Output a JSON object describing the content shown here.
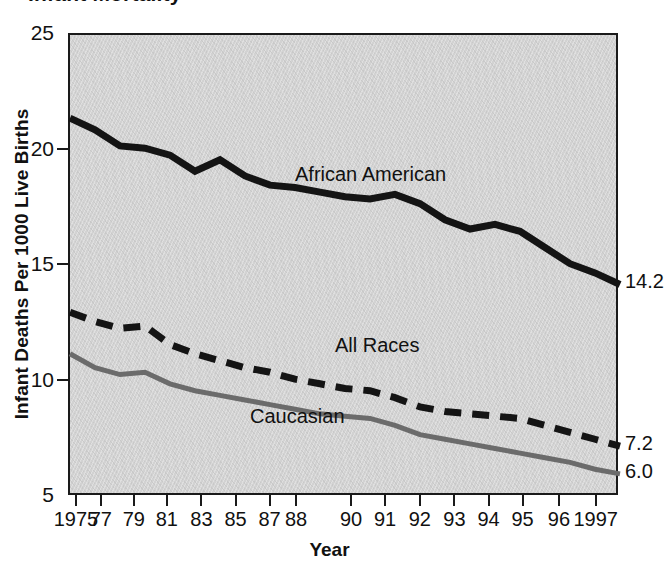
{
  "title": "Infant Mortality",
  "chart_data": {
    "type": "line",
    "title": "Infant Mortality",
    "xlabel": "Year",
    "ylabel": "Infant Deaths Per 1000 Live Births",
    "xlim": [
      1975,
      1997
    ],
    "ylim": [
      5,
      25
    ],
    "yticks": [
      25,
      20,
      15,
      10,
      5
    ],
    "ytick_labels": [
      "25",
      "20",
      "15",
      "10",
      "5"
    ],
    "grid": false,
    "legend": "inline-labels",
    "x": [
      1975,
      1976,
      1977,
      1978,
      1979,
      1980,
      1981,
      1982,
      1983,
      1984,
      1985,
      1986,
      1987,
      1988,
      1989,
      1990,
      1991,
      1992,
      1993,
      1994,
      1995,
      1996,
      1997
    ],
    "xtick_years": [
      1975,
      1977,
      1979,
      1981,
      1983,
      1985,
      1987,
      1988,
      1990,
      1991,
      1992,
      1993,
      1994,
      1995,
      1996,
      1997
    ],
    "xtick_labels": [
      "1975",
      "77",
      "79",
      "81",
      "83",
      "85",
      "87",
      "88",
      "90",
      "91",
      "92",
      "93",
      "94",
      "95",
      "96",
      "1997"
    ],
    "series": [
      {
        "name": "African American",
        "style": "solid",
        "color": "#141414",
        "width": 7,
        "label_x": 1984.0,
        "label_y": 18.95,
        "end_value": "14.2",
        "values": [
          21.4,
          20.9,
          20.2,
          20.1,
          19.8,
          19.1,
          19.6,
          18.9,
          18.5,
          18.4,
          18.2,
          18.0,
          17.9,
          18.1,
          17.7,
          17.0,
          16.6,
          16.8,
          16.5,
          15.8,
          15.1,
          14.7,
          14.2
        ]
      },
      {
        "name": "All Races",
        "style": "dashed",
        "color": "#141414",
        "width": 7,
        "label_x": 1985.6,
        "label_y": 11.55,
        "end_value": "7.2",
        "values": [
          13.0,
          12.6,
          12.3,
          12.4,
          11.6,
          11.2,
          10.9,
          10.6,
          10.4,
          10.1,
          9.9,
          9.7,
          9.6,
          9.3,
          8.9,
          8.7,
          8.6,
          8.5,
          8.4,
          8.1,
          7.8,
          7.5,
          7.2
        ]
      },
      {
        "name": "Caucasian",
        "style": "solid",
        "color": "#6b6b6b",
        "width": 5,
        "label_x": 1982.2,
        "label_y": 8.45,
        "end_value": "6.0",
        "values": [
          11.2,
          10.6,
          10.3,
          10.4,
          9.9,
          9.6,
          9.4,
          9.2,
          9.0,
          8.8,
          8.6,
          8.5,
          8.4,
          8.1,
          7.7,
          7.5,
          7.3,
          7.1,
          6.9,
          6.7,
          6.5,
          6.2,
          6.0
        ]
      }
    ]
  }
}
